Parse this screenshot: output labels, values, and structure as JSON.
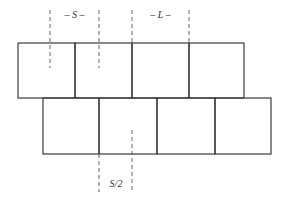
{
  "diagram": {
    "type": "staggered-block-layout",
    "top_row": {
      "count": 4,
      "x": 18,
      "y": 43,
      "box_width": 56.5,
      "box_height": 55
    },
    "bottom_row": {
      "count": 4,
      "x": 43,
      "y": 98,
      "box_width": 57,
      "box_height": 56
    },
    "labels": {
      "spacing": "– S –",
      "length": "– L –",
      "half_spacing": "S/2"
    },
    "colors": {
      "stroke": "#3a3a3a",
      "dash": "#555555",
      "background": "#ffffff"
    }
  }
}
